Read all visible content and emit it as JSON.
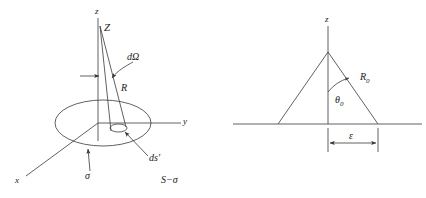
{
  "figure": {
    "background_color": "#ffffff",
    "stroke_color": "#3a3a3a",
    "text_color": "#1a1a1a",
    "caption": "S−σ"
  },
  "left_panel": {
    "name": "solid-angle-cone-on-disc",
    "axes": {
      "z_axis_label": "z",
      "y_axis_label": "y",
      "x_axis_label": "x"
    },
    "labels": {
      "field_point": "Z",
      "solid_angle": "dΩ",
      "distance": "R",
      "surface_element": "ds′",
      "surface_charge": "σ"
    }
  },
  "right_panel": {
    "name": "cone-cross-section",
    "axes": {
      "z_axis_label": "z"
    },
    "labels": {
      "radius": "R",
      "radius_sub": "0",
      "angle": "θ",
      "angle_sub": "0",
      "width_dimension": "ε"
    }
  }
}
